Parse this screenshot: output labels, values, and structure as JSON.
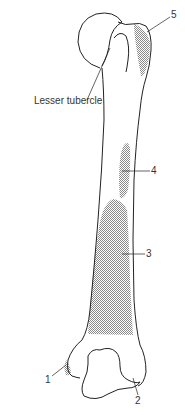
{
  "diagram": {
    "labels": {
      "lesser_tubercle": "Lesser tubercle",
      "l1": "1",
      "l2": "2",
      "l3": "3",
      "l4": "4",
      "l5": "5"
    },
    "colors": {
      "outline": "#222222",
      "shading": "#9a9a9a",
      "label_text": "#333333",
      "background": "#ffffff"
    }
  }
}
